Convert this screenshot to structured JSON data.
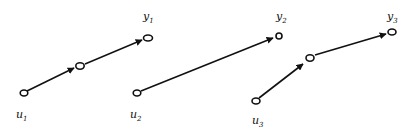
{
  "diagram": {
    "type": "directed-graph",
    "panels": [
      {
        "id": "panel-1",
        "input_label": {
          "base": "u",
          "sub": "1"
        },
        "output_label": {
          "base": "y",
          "sub": "1"
        },
        "nodes": [
          "u1",
          "intermediate",
          "y1"
        ],
        "edges": [
          [
            "u1",
            "intermediate"
          ],
          [
            "intermediate",
            "y1"
          ]
        ]
      },
      {
        "id": "panel-2",
        "input_label": {
          "base": "u",
          "sub": "2"
        },
        "output_label": {
          "base": "y",
          "sub": "2"
        },
        "nodes": [
          "u2",
          "y2"
        ],
        "edges": [
          [
            "u2",
            "y2"
          ]
        ]
      },
      {
        "id": "panel-3",
        "input_label": {
          "base": "u",
          "sub": "3"
        },
        "output_label": {
          "base": "y",
          "sub": "3"
        },
        "nodes": [
          "u3",
          "intermediate",
          "y3"
        ],
        "edges": [
          [
            "u3",
            "intermediate"
          ],
          [
            "intermediate",
            "y3"
          ]
        ]
      }
    ],
    "colors": {
      "stroke": "#111111",
      "background": "#ffffff"
    }
  }
}
